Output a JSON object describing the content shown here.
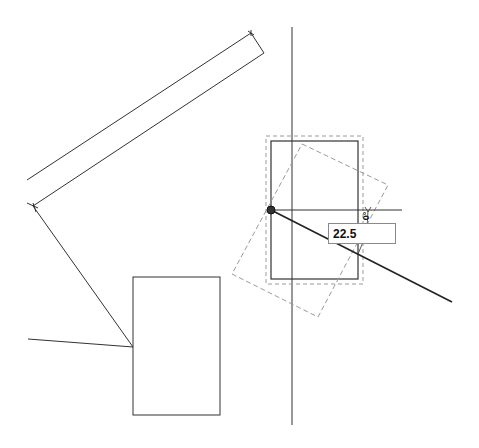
{
  "canvas": {
    "background": "#ffffff",
    "line_color": "#333333",
    "dash_color": "#9a9a9a"
  },
  "rotate_tool": {
    "angle_input_value": "22.5",
    "angle_indicator_label": "0°",
    "pivot_point": [
      271,
      210
    ]
  },
  "shapes": {
    "long_bar_upper": [
      [
        27,
        180
      ],
      [
        251,
        33
      ]
    ],
    "long_bar_lower": [
      [
        33,
        206
      ],
      [
        264,
        53
      ]
    ],
    "bar_end_cap": [
      [
        251,
        33
      ],
      [
        264,
        53
      ]
    ],
    "diagonal_leg": [
      [
        33,
        206
      ],
      [
        133,
        347
      ]
    ],
    "left_line": [
      [
        28,
        339
      ],
      [
        133,
        347
      ]
    ],
    "small_rect": {
      "x": 133,
      "y": 277,
      "w": 87,
      "h": 138
    },
    "selected_rect": {
      "x": 271,
      "y": 141,
      "w": 87,
      "h": 138
    },
    "selection_bounds": {
      "x": 266,
      "y": 136,
      "w": 97,
      "h": 148
    },
    "rotated_preview": [
      [
        302,
        144
      ],
      [
        388,
        185
      ],
      [
        318,
        317
      ],
      [
        232,
        274
      ]
    ],
    "vertical_axis": [
      [
        292,
        27
      ],
      [
        292,
        425
      ]
    ],
    "reference_horizontal": [
      [
        271,
        210
      ],
      [
        402,
        210
      ]
    ],
    "rotation_ray": [
      [
        271,
        210
      ],
      [
        452,
        302
      ]
    ]
  }
}
